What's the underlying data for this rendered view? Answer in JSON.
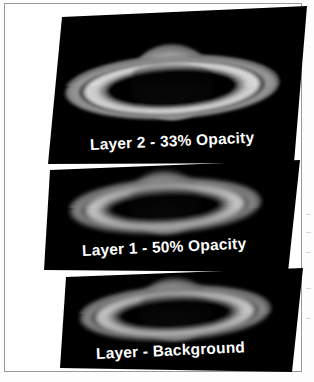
{
  "figure": {
    "background_color": "#ffffff",
    "border_color": "#9a9a9a",
    "slab_color": "#000000",
    "caption_color": "#ffffff"
  },
  "layers": [
    {
      "id": "layer-2",
      "caption": "Layer 2 - 33% Opacity",
      "name": "Layer 2",
      "opacity_label": "33% Opacity",
      "opacity_percent": 33,
      "position": "top"
    },
    {
      "id": "layer-1",
      "caption": "Layer 1 - 50% Opacity",
      "name": "Layer 1",
      "opacity_label": "50% Opacity",
      "opacity_percent": 50,
      "position": "middle"
    },
    {
      "id": "layer-background",
      "caption": "Layer - Background",
      "name": "Layer",
      "opacity_label": "Background",
      "opacity_percent": 100,
      "position": "bottom"
    }
  ],
  "image_content": {
    "object": "Saturn",
    "features": [
      "planet-disc",
      "ring-system",
      "cassini-division",
      "ring-shadow"
    ],
    "palette": {
      "space": "#000000",
      "planet_bright": "#f2f2f2",
      "planet_mid": "#b9b9b9",
      "ring_bright": "#d8d8d8",
      "ring_dim": "#6d6d6d",
      "division": "#151515"
    }
  }
}
